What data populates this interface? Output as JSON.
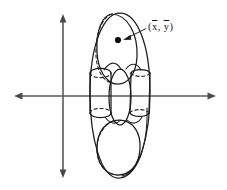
{
  "figure": {
    "name": "centroid-diagram",
    "background_color": "#ffffff",
    "ink_color": "#1b1b1b",
    "axis_color": "#5a5a5a"
  },
  "axes": {
    "horizontal": {
      "label": "horizontal-axis",
      "y": 96,
      "x_start": 14,
      "x_end": 216,
      "arrow_left": true,
      "arrow_right": true
    },
    "vertical": {
      "label": "vertical-axis",
      "x": 63,
      "y_start": 14,
      "y_end": 178,
      "arrow_up": true,
      "arrow_down": true
    },
    "origin": {
      "x": 63,
      "y": 96
    }
  },
  "centroid": {
    "label_open_paren": "(",
    "label_x": "x",
    "label_separator": ", ",
    "label_y": "y",
    "label_close_paren": ")",
    "label_plain": "(x̄, ȳ)",
    "dot": {
      "x": 118,
      "y": 40,
      "radius": 3.1
    },
    "leader": {
      "from_x": 146,
      "from_y": 29,
      "to_x": 124,
      "to_y": 39
    }
  },
  "solid": {
    "outer_body": {
      "name": "outer-ellipse-silhouette",
      "cx": 120,
      "cy": 96,
      "rx": 30,
      "ry": 83
    },
    "top_lobe": {
      "name": "top-ellipsoid-lobe",
      "cx": 117,
      "cy": 48,
      "rx": 20,
      "ry": 35,
      "rotation": -8
    },
    "bottom_lobe": {
      "name": "bottom-ellipsoid-lobe",
      "cx": 119,
      "cy": 147,
      "rx": 20,
      "ry": 27,
      "rotation": 4
    },
    "center_column": {
      "name": "center-vertical-ellipse",
      "cx": 120,
      "cy": 97,
      "rx": 11,
      "ry": 28
    },
    "left_cylinder": {
      "name": "left-cylinder",
      "cx": 100,
      "top_y": 73,
      "bottom_y": 114,
      "rx": 11,
      "ry": 4.5
    },
    "right_cylinder": {
      "name": "right-cylinder",
      "cx": 140,
      "top_y": 73,
      "bottom_y": 114,
      "rx": 10,
      "ry": 4.5
    }
  }
}
